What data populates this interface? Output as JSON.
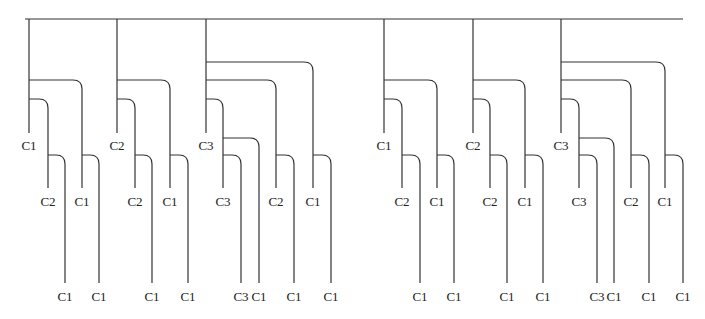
{
  "diagram": {
    "type": "tree",
    "root_line": {
      "x1": 25,
      "x2": 683,
      "y": 19
    },
    "groups": [
      {
        "label": "C1",
        "x": 29,
        "branches": [
          {
            "label": "C1",
            "x": 82,
            "y": 80,
            "child": {
              "label": "C1",
              "x": 99,
              "y": 155
            }
          },
          {
            "label": "C2",
            "x": 48,
            "y": 99,
            "child": {
              "label": "C1",
              "x": 65,
              "y": 155
            }
          }
        ]
      },
      {
        "label": "C2",
        "x": 117,
        "branches": [
          {
            "label": "C1",
            "x": 170,
            "y": 80,
            "child": {
              "label": "C1",
              "x": 188,
              "y": 155
            }
          },
          {
            "label": "C2",
            "x": 135,
            "y": 99,
            "child": {
              "label": "C1",
              "x": 152,
              "y": 155
            }
          }
        ]
      },
      {
        "label": "C3",
        "x": 206,
        "branches": [
          {
            "label": "C1",
            "x": 313,
            "y": 62,
            "child": {
              "label": "C1",
              "x": 331,
              "y": 155
            }
          },
          {
            "label": "C2",
            "x": 276,
            "y": 80,
            "child": {
              "label": "C1",
              "x": 294,
              "y": 155
            }
          },
          {
            "label": "C3",
            "x": 223,
            "y": 99,
            "children": [
              {
                "label": "C1",
                "x": 259,
                "y": 138
              },
              {
                "label": "C3",
                "x": 241,
                "y": 155
              }
            ]
          }
        ]
      },
      {
        "label": "C1",
        "x": 384,
        "branches": [
          {
            "label": "C1",
            "x": 437,
            "y": 80,
            "child": {
              "label": "C1",
              "x": 454,
              "y": 155
            }
          },
          {
            "label": "C2",
            "x": 402,
            "y": 99,
            "child": {
              "label": "C1",
              "x": 420,
              "y": 155
            }
          }
        ]
      },
      {
        "label": "C2",
        "x": 473,
        "branches": [
          {
            "label": "C1",
            "x": 525,
            "y": 80,
            "child": {
              "label": "C1",
              "x": 543,
              "y": 155
            }
          },
          {
            "label": "C2",
            "x": 490,
            "y": 99,
            "child": {
              "label": "C1",
              "x": 507,
              "y": 155
            }
          }
        ]
      },
      {
        "label": "C3",
        "x": 561,
        "branches": [
          {
            "label": "C1",
            "x": 665,
            "y": 62,
            "child": {
              "label": "C1",
              "x": 683,
              "y": 155
            }
          },
          {
            "label": "C2",
            "x": 631,
            "y": 80,
            "child": {
              "label": "C1",
              "x": 649,
              "y": 155
            }
          },
          {
            "label": "C3",
            "x": 579,
            "y": 99,
            "children": [
              {
                "label": "C1",
                "x": 614,
                "y": 138
              },
              {
                "label": "C3",
                "x": 597,
                "y": 155
              }
            ]
          }
        ]
      }
    ],
    "levels": {
      "trunk_end": 133,
      "trunk_label_y": 150,
      "mid_end": 188,
      "mid_label_y": 206,
      "leaf_end": 283,
      "leaf_label_y": 301
    },
    "colors": {
      "line": "#333333",
      "text": "#222222",
      "background": "#ffffff"
    }
  }
}
